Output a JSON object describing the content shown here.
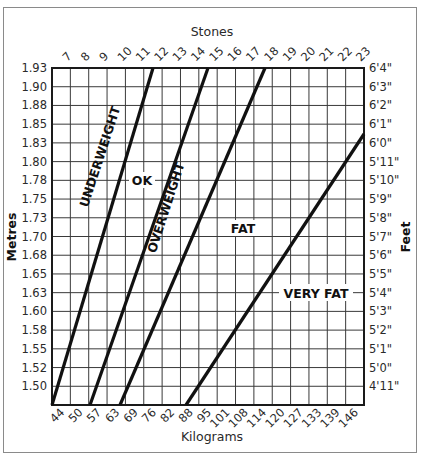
{
  "chart_data": {
    "type": "line",
    "title": "",
    "top_axis": {
      "label": "Stones",
      "ticks": [
        "7",
        "8",
        "9",
        "10",
        "11",
        "12",
        "13",
        "14",
        "15",
        "16",
        "17",
        "18",
        "19",
        "20",
        "21",
        "22",
        "23"
      ]
    },
    "bottom_axis": {
      "label": "Kilograms",
      "ticks": [
        "44",
        "50",
        "57",
        "63",
        "69",
        "76",
        "82",
        "88",
        "95",
        "101",
        "108",
        "114",
        "120",
        "127",
        "133",
        "139",
        "146"
      ]
    },
    "left_axis": {
      "label": "Metres",
      "ticks": [
        "1.93",
        "1.90",
        "1.88",
        "1.85",
        "1.83",
        "1.80",
        "1.78",
        "1.75",
        "1.73",
        "1.70",
        "1.68",
        "1.65",
        "1.63",
        "1.60",
        "1.58",
        "1.55",
        "1.52",
        "1.50"
      ]
    },
    "right_axis": {
      "label": "Feet",
      "ticks": [
        "6'4\"",
        "6'3\"",
        "6'2\"",
        "6'1\"",
        "6'0\"",
        "5'11\"",
        "5'10\"",
        "5'9\"",
        "5'8\"",
        "5'7\"",
        "5'6\"",
        "5'5\"",
        "5'4\"",
        "5'3\"",
        "5'2\"",
        "5'1\"",
        "5'0\"",
        "4'11\""
      ]
    },
    "zones": [
      "UNDERWEIGHT",
      "OK",
      "OVERWEIGHT",
      "FAT",
      "VERY FAT"
    ],
    "boundary_lines": [
      {
        "name": "underweight/ok",
        "points_kg_m": [
          [
            41,
            1.47
          ],
          [
            60,
            1.93
          ]
        ]
      },
      {
        "name": "ok/overweight",
        "points_kg_m": [
          [
            48,
            1.47
          ],
          [
            70,
            1.93
          ]
        ]
      },
      {
        "name": "overweight/fat",
        "points_kg_m": [
          [
            54,
            1.47
          ],
          [
            80,
            1.93
          ]
        ]
      },
      {
        "name": "fat/very-fat",
        "points_kg_m": [
          [
            66,
            1.47
          ],
          [
            146,
            1.88
          ]
        ]
      }
    ],
    "grid": true,
    "xlabel": "Kilograms",
    "ylabel": "Metres"
  }
}
